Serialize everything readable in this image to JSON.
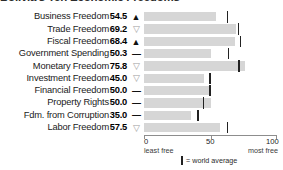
{
  "title": "Bolivia's Ten Economic Freedoms",
  "chart_data": {
    "type": "bar",
    "title": "Bolivia's Ten Economic Freedoms",
    "xlabel": "",
    "ylabel": "",
    "xlim": [
      0,
      100
    ],
    "grid": false,
    "categories": [
      "Business Freedom",
      "Trade Freedom",
      "Fiscal Freedom",
      "Government Spending",
      "Monetary Freedom",
      "Investment Freedom",
      "Financial Freedom",
      "Property Rights",
      "Fdm. from Corruption",
      "Labor Freedom"
    ],
    "values": [
      54.5,
      69.2,
      68.4,
      50.3,
      75.8,
      45.0,
      50.0,
      50.0,
      35.0,
      57.5
    ],
    "value_labels": [
      "54.5",
      "69.2",
      "68.4",
      "50.3",
      "75.8",
      "45.0",
      "50.0",
      "50.0",
      "35.0",
      "57.5"
    ],
    "trend": [
      "up",
      "down",
      "up",
      "flat",
      "down",
      "down",
      "flat",
      "flat",
      "flat",
      "down"
    ],
    "trend_glyphs": [
      "▲",
      "▽",
      "▲",
      "—",
      "▽",
      "▽",
      "—",
      "—",
      "—",
      "▽"
    ],
    "world_average": [
      62.3,
      70.3,
      72.0,
      63.0,
      71.0,
      49.0,
      49.0,
      44.0,
      40.0,
      62.1
    ],
    "ticks": [
      {
        "value": 0,
        "label": "0",
        "sublabel": "least free"
      },
      {
        "value": 50,
        "label": "50",
        "sublabel": ""
      },
      {
        "value": 100,
        "label": "100",
        "sublabel": "most free"
      }
    ],
    "legend": {
      "marker_label": "= world average"
    },
    "colors": {
      "bar": "#d6d6d6",
      "marker": "#222222",
      "axis": "#8d8d8d",
      "text": "#1a1a1a"
    }
  },
  "axis": {
    "tick_0": "0",
    "tick_50": "50",
    "tick_100": "100",
    "least_free": "least free",
    "most_free": "most free"
  },
  "legend": {
    "world_average_label": "= world average"
  }
}
